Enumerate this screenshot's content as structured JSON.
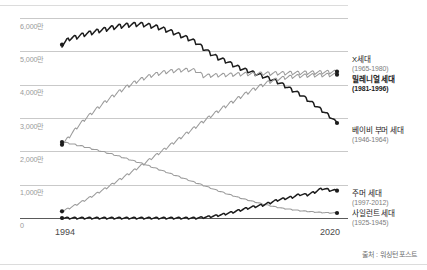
{
  "chart_data": {
    "type": "line",
    "title": "",
    "subtitle": "",
    "xlabel": "",
    "ylabel": "",
    "xlim": [
      1994,
      2020
    ],
    "ylim": [
      0,
      60000000
    ],
    "grid": true,
    "legend_position": "right-inline",
    "unit_suffix": "만",
    "y_ticks": [
      {
        "value": 60000000,
        "label": "6,000만"
      },
      {
        "value": 50000000,
        "label": "5,000만"
      },
      {
        "value": 40000000,
        "label": "4,000만"
      },
      {
        "value": 30000000,
        "label": "3,000만"
      },
      {
        "value": 20000000,
        "label": "2,000만"
      },
      {
        "value": 10000000,
        "label": "1,000만"
      },
      {
        "value": 0,
        "label": "0"
      }
    ],
    "x_ticks": [
      {
        "value": 1994,
        "label": "1994"
      },
      {
        "value": 2020,
        "label": "2020"
      }
    ],
    "series": [
      {
        "name": "베이비 부머 세대",
        "range": "(1946-1964)",
        "color": "#1c1c1c",
        "bold": false,
        "start_value": 52000000,
        "peak_value": 58200000,
        "end_value": 28500000,
        "values": [
          52000000,
          53900000,
          54400000,
          55200000,
          55700000,
          56300000,
          56800000,
          57300000,
          57700000,
          58000000,
          58200000,
          58100000,
          57700000,
          57200000,
          56500000,
          55700000,
          54800000,
          53900000,
          52800000,
          51000000,
          49400000,
          48100000,
          47200000,
          46000000,
          45000000,
          44200000,
          43400000,
          42600000,
          41800000,
          40900000,
          39700000,
          38400000,
          37200000,
          35600000,
          34000000,
          32300000,
          30600000,
          28500000
        ]
      },
      {
        "name": "X세대",
        "range": "(1965-1980)",
        "color": "#9b9b9b",
        "bold": false,
        "start_value": 22000000,
        "peak_value": 44500000,
        "end_value": 43900000,
        "values": [
          22000000,
          24500000,
          27200000,
          29500000,
          31500000,
          33400000,
          35200000,
          36900000,
          38400000,
          39800000,
          41000000,
          42000000,
          42800000,
          43400000,
          43900000,
          44200000,
          44400000,
          44500000,
          44300000,
          42700000,
          42800000,
          42900000,
          43000000,
          43100000,
          43200000,
          43300000,
          43300000,
          43400000,
          43400000,
          43500000,
          43500000,
          43600000,
          43600000,
          43700000,
          43700000,
          43800000,
          43850000,
          43900000
        ]
      },
      {
        "name": "밀레니얼 세대",
        "range": "(1981-1996)",
        "color": "#9b9b9b",
        "bold": true,
        "start_value": 2000000,
        "peak_value": 43000000,
        "end_value": 43000000,
        "values": [
          2000000,
          3000000,
          4100000,
          5300000,
          6500000,
          7800000,
          9100000,
          10500000,
          11900000,
          13300000,
          14800000,
          16300000,
          17900000,
          19400000,
          21000000,
          22600000,
          24200000,
          25800000,
          27400000,
          29000000,
          30600000,
          32100000,
          33600000,
          35000000,
          36400000,
          37700000,
          38900000,
          40000000,
          41000000,
          41700000,
          42200000,
          42500000,
          42700000,
          42800000,
          42900000,
          42950000,
          43000000,
          43000000
        ]
      },
      {
        "name": "사일런트 세대",
        "range": "(1925-1945)",
        "color": "#9b9b9b",
        "bold": false,
        "start_value": 22800000,
        "peak_value": 22800000,
        "end_value": 1500000,
        "values": [
          22800000,
          22400000,
          21900000,
          21400000,
          20800000,
          20200000,
          19600000,
          19000000,
          18300000,
          17600000,
          16900000,
          16200000,
          15400000,
          14600000,
          13800000,
          13000000,
          12200000,
          11400000,
          10600000,
          9800000,
          9000000,
          8200000,
          7400000,
          6700000,
          6000000,
          5400000,
          4800000,
          4200000,
          3700000,
          3200000,
          2800000,
          2500000,
          2200000,
          2000000,
          1800000,
          1650000,
          1550000,
          1500000
        ]
      },
      {
        "name": "주머 세대",
        "range": "(1997-2012)",
        "color": "#1c1c1c",
        "bold": false,
        "start_value": 0,
        "peak_value": 8900000,
        "end_value": 8200000,
        "values": [
          0,
          0,
          0,
          0,
          0,
          0,
          0,
          0,
          0,
          0,
          0,
          0,
          0,
          0,
          0,
          0,
          0,
          0,
          0,
          200000,
          450000,
          800000,
          1250000,
          1800000,
          2400000,
          3000000,
          3500000,
          3900000,
          4600000,
          5400000,
          5900000,
          6300000,
          7100000,
          7000000,
          7800000,
          8900000,
          8400000,
          8200000
        ]
      }
    ]
  },
  "legend": [
    {
      "name": "X세대",
      "range": "(1965-1980)",
      "bold": false
    },
    {
      "name": "밀레니얼 세대",
      "range": "(1981-1996)",
      "bold": true
    },
    {
      "name": "베이비 부머 세대",
      "range": "(1946-1964)",
      "bold": false
    },
    {
      "name": "주머 세대",
      "range": "(1997-2012)",
      "bold": false
    },
    {
      "name": "사일런트 세대",
      "range": "(1925-1945)",
      "bold": false
    }
  ],
  "source": {
    "text": "출처 : 워싱턴 포스트"
  }
}
